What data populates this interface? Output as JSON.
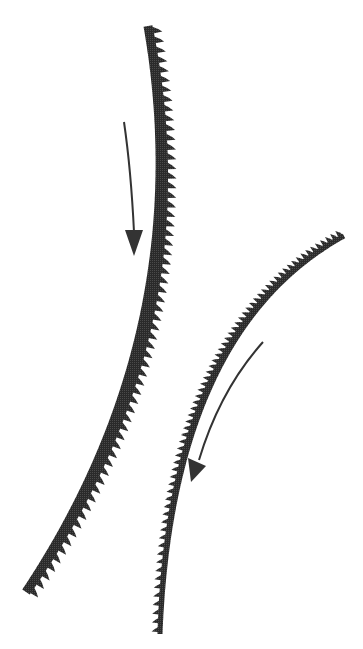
{
  "diagram": {
    "title": "",
    "background": "#ffffff",
    "ink_color": "#2e2e2e",
    "elements": [
      {
        "id": "rack-large",
        "kind": "toothed-arc",
        "description": "Large curved toothed band, teeth on right/outer side",
        "start": [
          148,
          26
        ],
        "end": [
          26,
          592
        ],
        "teeth_side": "right"
      },
      {
        "id": "rack-small",
        "kind": "toothed-arc",
        "description": "Smaller curved toothed band, teeth on upper-left side",
        "start": [
          344,
          236
        ],
        "end": [
          160,
          634
        ],
        "teeth_side": "left"
      },
      {
        "id": "arrow-large",
        "kind": "direction-arrow",
        "description": "Downward arrow showing motion of large band",
        "start": [
          124,
          122
        ],
        "end": [
          134,
          255
        ]
      },
      {
        "id": "arrow-small",
        "kind": "direction-arrow",
        "description": "Down-left arrow showing motion of small band",
        "start": [
          263,
          342
        ],
        "end": [
          192,
          482
        ]
      }
    ]
  }
}
